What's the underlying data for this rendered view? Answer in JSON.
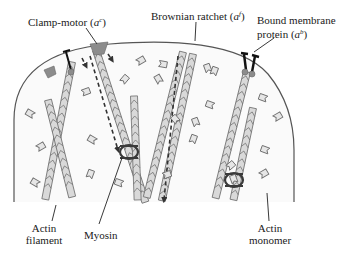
{
  "diagram": {
    "colors": {
      "membrane": "#555555",
      "filament_fill": "#d9d9d9",
      "filament_stroke": "#6e6e6e",
      "monomer_fill": "#e6e6e6",
      "monomer_stroke": "#6e6e6e",
      "clamp_motor": "#8c8c8c",
      "bound_protein": "#222222",
      "myosin": "#3a3a3a",
      "arrows": "#333333"
    },
    "labels": {
      "clamp_motor": {
        "text": "Clamp-motor (",
        "var": "a",
        "sup": "c",
        "close": ")"
      },
      "brownian_ratchet": {
        "text": "Brownian ratchet (",
        "var": "a",
        "sup": "f",
        "close": ")"
      },
      "bound_membrane_protein": {
        "line1": "Bound membrane",
        "line2": "protein (",
        "var": "a",
        "sup": "b",
        "close": ")"
      },
      "actin_filament": {
        "line1": "Actin",
        "line2": "filament"
      },
      "myosin": {
        "text": "Myosin"
      },
      "actin_monomer": {
        "line1": "Actin",
        "line2": "monomer"
      }
    }
  }
}
